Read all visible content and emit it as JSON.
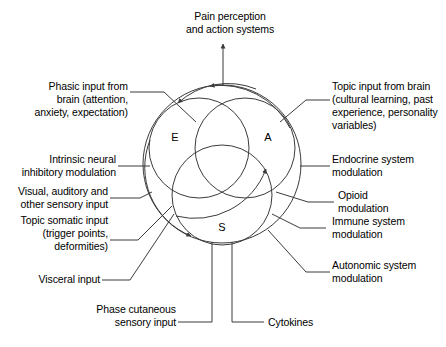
{
  "diagram": {
    "title_top": "Pain perception\nand action systems",
    "venn": {
      "letters": [
        {
          "id": "E",
          "label": "E"
        },
        {
          "id": "A",
          "label": "A"
        },
        {
          "id": "S",
          "label": "S"
        }
      ]
    },
    "labels_left": [
      {
        "id": "phasic-input-from-brain",
        "text": "Phasic input from\nbrain (attention,\nanxiety, expectation)"
      },
      {
        "id": "intrinsic-neural-inhibitory-modulation",
        "text": "Intrinsic neural\ninhibitory modulation"
      },
      {
        "id": "visual-auditory-other-sensory-input",
        "text": "Visual, auditory and\nother sensory input"
      },
      {
        "id": "topic-somatic-input",
        "text": "Topic somatic input\n(trigger points,\ndeformities)"
      },
      {
        "id": "visceral-input",
        "text": "Visceral input"
      }
    ],
    "labels_right": [
      {
        "id": "topic-input-from-brain",
        "text": "Topic input from brain\n(cultural learning, past\nexperience, personality\nvariables)"
      },
      {
        "id": "endocrine-system-modulation",
        "text": "Endocrine system\nmodulation"
      },
      {
        "id": "opioid-modulation",
        "text": "Opioid\nmodulation"
      },
      {
        "id": "immune-system-modulation",
        "text": "Immune system\nmodulation"
      },
      {
        "id": "autonomic-system-modulation",
        "text": "Autonomic system\nmodulation"
      }
    ],
    "labels_bottom": [
      {
        "id": "phase-cutaneous-sensory-input",
        "text": "Phase cutaneous\nsensory input"
      },
      {
        "id": "cytokines",
        "text": "Cytokines"
      }
    ],
    "colors": {
      "stroke": "#3b3b3b",
      "text": "#000000",
      "background": "#ffffff"
    }
  }
}
